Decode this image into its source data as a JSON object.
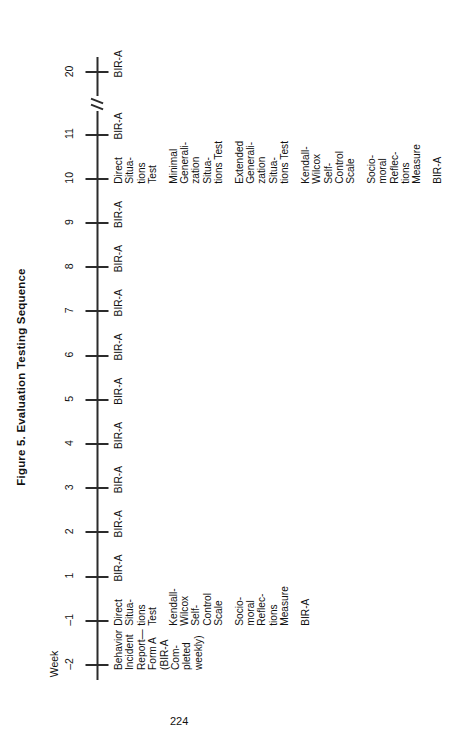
{
  "figure": {
    "title": "Figure 5.  Evaluation Testing Sequence",
    "axis_label": "Week",
    "ticks": [
      "–2",
      "–1",
      "1",
      "2",
      "3",
      "4",
      "5",
      "6",
      "7",
      "8",
      "9",
      "10",
      "11",
      "20"
    ],
    "axis_break_between": [
      "11",
      "20"
    ],
    "columns": [
      {
        "week": "–2",
        "entries": [
          {
            "lines": [
              "Behavior",
              "Incident",
              "Report—",
              "Form A",
              "(BIR-A",
              "Com-",
              "pleted",
              "weekly)"
            ]
          }
        ]
      },
      {
        "week": "–1",
        "entries": [
          {
            "lines": [
              "Direct",
              "Situa-",
              "tions",
              "Test"
            ]
          },
          {
            "lines": [
              "Kendall-",
              "Wilcox",
              "Self-",
              "Control",
              "Scale"
            ]
          },
          {
            "lines": [
              "Socio-",
              "moral",
              "Reflec-",
              "tions",
              "Measure"
            ]
          },
          {
            "lines": [
              "BIR-A"
            ]
          }
        ]
      },
      {
        "week": "1",
        "entries": [
          {
            "lines": [
              "BIR-A"
            ]
          }
        ]
      },
      {
        "week": "2",
        "entries": [
          {
            "lines": [
              "BIR-A"
            ]
          }
        ]
      },
      {
        "week": "3",
        "entries": [
          {
            "lines": [
              "BIR-A"
            ]
          }
        ]
      },
      {
        "week": "4",
        "entries": [
          {
            "lines": [
              "BIR-A"
            ]
          }
        ]
      },
      {
        "week": "5",
        "entries": [
          {
            "lines": [
              "BIR-A"
            ]
          }
        ]
      },
      {
        "week": "6",
        "entries": [
          {
            "lines": [
              "BIR-A"
            ]
          }
        ]
      },
      {
        "week": "7",
        "entries": [
          {
            "lines": [
              "BIR-A"
            ]
          }
        ]
      },
      {
        "week": "8",
        "entries": [
          {
            "lines": [
              "BIR-A"
            ]
          }
        ]
      },
      {
        "week": "9",
        "entries": [
          {
            "lines": [
              "BIR-A"
            ]
          }
        ]
      },
      {
        "week": "10",
        "entries": [
          {
            "lines": [
              "Direct",
              "Situa-",
              "tions",
              "Test"
            ]
          },
          {
            "lines": [
              "Minimal",
              "Generali-",
              "zation",
              "Situa-",
              "tions Test"
            ]
          },
          {
            "lines": [
              "Extended",
              "Generali-",
              "zation",
              "Situa-",
              "tions Test"
            ]
          },
          {
            "lines": [
              "Kendall-",
              "Wilcox",
              "Self-",
              "Control",
              "Scale"
            ]
          },
          {
            "lines": [
              "Socio-",
              "moral",
              "Reflec-",
              "tions",
              "Measure"
            ]
          },
          {
            "lines": [
              "BIR-A"
            ]
          }
        ]
      },
      {
        "week": "11",
        "entries": [
          {
            "lines": [
              "BIR-A"
            ]
          }
        ]
      },
      {
        "week": "20",
        "entries": [
          {
            "lines": [
              "BIR-A"
            ]
          }
        ]
      }
    ]
  },
  "page": {
    "number": "224"
  },
  "colors": {
    "ink": "#1a1a1a",
    "paper": "#ffffff",
    "rule": "#2b2b2b"
  }
}
